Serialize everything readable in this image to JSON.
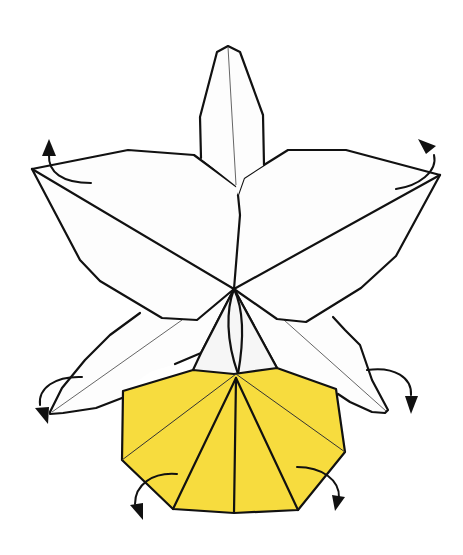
{
  "diagram": {
    "colors": {
      "paper_white": "#fdfdfd",
      "paper_yellow": "#f7dc3e",
      "line": "#111111",
      "crease": "#555555",
      "background": "#ffffff"
    },
    "parts": [
      {
        "name": "top-petal",
        "color": "white"
      },
      {
        "name": "left-wing-petal",
        "color": "white"
      },
      {
        "name": "right-wing-petal",
        "color": "white"
      },
      {
        "name": "lower-left-petal",
        "color": "white"
      },
      {
        "name": "lower-right-petal",
        "color": "white"
      },
      {
        "name": "lip",
        "color": "yellow"
      }
    ],
    "arrows": [
      {
        "name": "upper-left-curl-arrow",
        "direction": "up"
      },
      {
        "name": "upper-right-curl-arrow",
        "direction": "up"
      },
      {
        "name": "lower-left-curl-arrow",
        "direction": "down"
      },
      {
        "name": "lower-right-curl-arrow",
        "direction": "down"
      },
      {
        "name": "lip-left-curl-arrow",
        "direction": "down"
      },
      {
        "name": "lip-right-curl-arrow",
        "direction": "down"
      }
    ]
  }
}
